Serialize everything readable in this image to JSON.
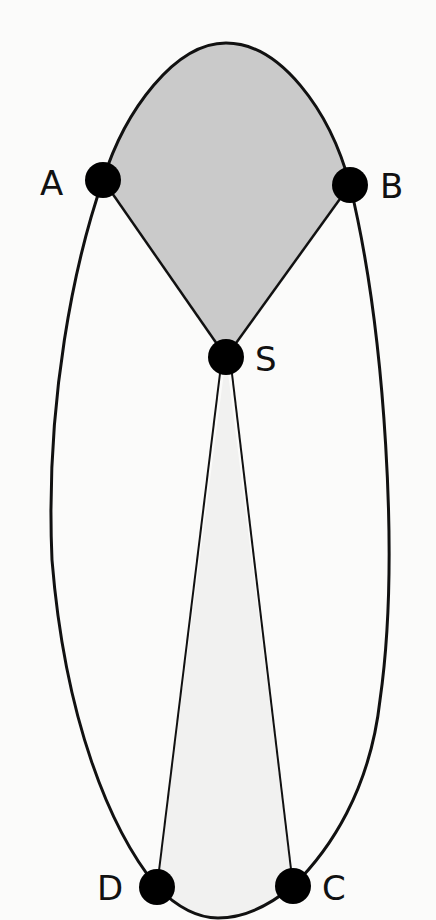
{
  "diagram": {
    "title": "",
    "colors": {
      "background": "#fbfbfa",
      "outline": "#111111",
      "upper_region_fill": "#cacaca",
      "lower_region_fill": "#f1f1f0",
      "node_fill": "#000000"
    },
    "nodes": [
      {
        "id": "A",
        "label": "A",
        "x": 103,
        "y": 180
      },
      {
        "id": "B",
        "label": "B",
        "x": 350,
        "y": 185
      },
      {
        "id": "S",
        "label": "S",
        "x": 226,
        "y": 357
      },
      {
        "id": "D",
        "label": "D",
        "x": 157,
        "y": 887
      },
      {
        "id": "C",
        "label": "C",
        "x": 293,
        "y": 886
      }
    ],
    "edges": [
      {
        "from": "A",
        "to": "S",
        "type": "straight"
      },
      {
        "from": "B",
        "to": "S",
        "type": "straight"
      },
      {
        "from": "S",
        "to": "D",
        "type": "straight"
      },
      {
        "from": "S",
        "to": "C",
        "type": "straight"
      },
      {
        "from": "A",
        "to": "B",
        "type": "arc-top"
      },
      {
        "from": "A",
        "to": "D",
        "type": "arc-left"
      },
      {
        "from": "B",
        "to": "C",
        "type": "arc-right"
      },
      {
        "from": "D",
        "to": "C",
        "type": "arc-bottom"
      }
    ],
    "regions": [
      {
        "name": "upper-region",
        "bounded_by": [
          "A",
          "B",
          "S"
        ],
        "shade": "dark-gray"
      },
      {
        "name": "lower-region",
        "bounded_by": [
          "S",
          "D",
          "C"
        ],
        "shade": "light-gray"
      }
    ]
  }
}
